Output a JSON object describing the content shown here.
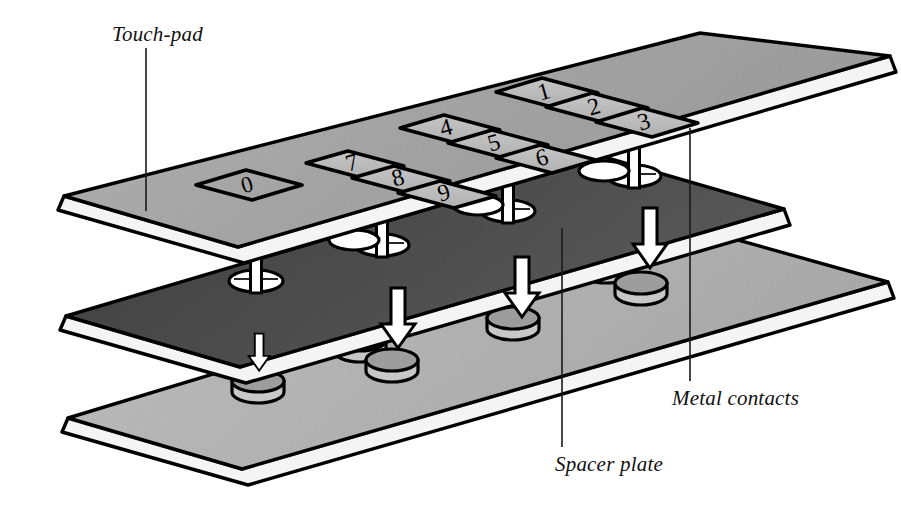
{
  "figure": {
    "background_color": "#ffffff",
    "width": 901,
    "height": 517
  },
  "callouts": [
    {
      "id": "touch-pad",
      "label": "Touch-pad",
      "label_x": 112,
      "label_y": 22,
      "leader": {
        "x1": 146,
        "y1": 48,
        "x2": 146,
        "y2": 211
      }
    },
    {
      "id": "spacer-plate",
      "label": "Spacer plate",
      "label_x": 555,
      "label_y": 452,
      "leader": {
        "x1": 562,
        "y1": 447,
        "x2": 562,
        "y2": 228
      }
    },
    {
      "id": "metal-contacts",
      "label": "Metal contacts",
      "label_x": 672,
      "label_y": 386,
      "leader": {
        "x1": 690,
        "y1": 381,
        "x2": 690,
        "y2": 128
      }
    }
  ],
  "layers": [
    {
      "id": "touch-pad",
      "name": "Touch-pad",
      "role": "top membrane with printed keys",
      "face_color": "#a9a9a9",
      "edge_color": "#f2f2f2",
      "outline_color": "#000000"
    },
    {
      "id": "spacer-plate",
      "name": "Spacer plate",
      "role": "middle insulating plate with holes",
      "face_color": "#4a4a4a",
      "edge_color": "#f2f2f2",
      "outline_color": "#000000",
      "hole_count": 5,
      "hole_fill": "#ffffff",
      "pin_fill": "#ffffff"
    },
    {
      "id": "contact-plate",
      "name": "Metal contacts",
      "role": "bottom plate carrying contact discs",
      "face_color": "#b8b8b8",
      "edge_color": "#f2f2f2",
      "outline_color": "#000000",
      "disc_count": 6,
      "disc_top_color": "#9a9a9a",
      "disc_side_color": "#c6c6c6"
    }
  ],
  "keypad": {
    "layout_note": "single slanted row of keys, left to right",
    "keys": [
      {
        "label": "0",
        "boxed": true
      },
      {
        "label": "7",
        "boxed": false
      },
      {
        "label": "8",
        "boxed": false
      },
      {
        "label": "9",
        "boxed": false
      },
      {
        "label": "4",
        "boxed": false
      },
      {
        "label": "5",
        "boxed": false
      },
      {
        "label": "6",
        "boxed": false
      },
      {
        "label": "1",
        "boxed": false
      },
      {
        "label": "2",
        "boxed": false
      },
      {
        "label": "3",
        "boxed": false
      }
    ],
    "key_face_color": "#bdbdbd",
    "key_outline_color": "#000000"
  },
  "arrows": {
    "count": 5,
    "direction": "down",
    "fill": "#ffffff",
    "stroke": "#000000",
    "meaning": "pin presses through hole onto metal contact"
  },
  "colors": {
    "ink": "#000000",
    "paper": "#ffffff",
    "top_plate": "#a9a9a9",
    "spacer_plate": "#4a4a4a",
    "bottom_plate": "#b8b8b8",
    "plate_edge": "#f2f2f2"
  }
}
